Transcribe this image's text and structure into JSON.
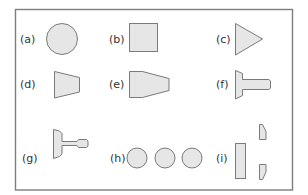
{
  "diagram": {
    "type": "shape-panel-grid",
    "layout": {
      "rows": 3,
      "columns": 3
    },
    "colors": {
      "fill": "#e6e6e6",
      "stroke": "#7a7a7a",
      "frame": "#7d7d7d",
      "label": "#333333",
      "background": "#ffffff"
    },
    "panels": [
      {
        "label": "(a)",
        "shape": "circle"
      },
      {
        "label": "(b)",
        "shape": "square"
      },
      {
        "label": "(c)",
        "shape": "triangle"
      },
      {
        "label": "(d)",
        "shape": "trapezoid"
      },
      {
        "label": "(e)",
        "shape": "tapered-hexagon"
      },
      {
        "label": "(f)",
        "shape": "t-bar-with-flange"
      },
      {
        "label": "(g)",
        "shape": "flanged-shaft-with-knob"
      },
      {
        "label": "(h)",
        "shape": "three-circles"
      },
      {
        "label": "(i)",
        "shape": "rectangle-and-two-clipped-blocks"
      }
    ]
  }
}
